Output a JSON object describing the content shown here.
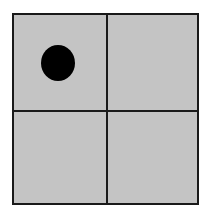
{
  "board": {
    "rows": 2,
    "cols": 2,
    "background_color": "#c4c4c4",
    "line_color": "#1a1a1a",
    "cells": [
      {
        "row": 0,
        "col": 0,
        "piece": "black-disc"
      },
      {
        "row": 0,
        "col": 1,
        "piece": null
      },
      {
        "row": 1,
        "col": 0,
        "piece": null
      },
      {
        "row": 1,
        "col": 1,
        "piece": null
      }
    ],
    "piece_color": "#000000"
  }
}
